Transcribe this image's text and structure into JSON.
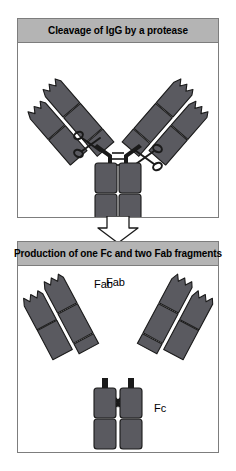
{
  "figure": {
    "type": "diagram",
    "background_color": "#ffffff",
    "panel_border_color": "#7d7d7d",
    "header_fill_color": "#b4b4b4",
    "protein_fill_color": "#5a5a60",
    "protein_outline_color": "#1a1a1a",
    "arrow_fill_color": "#ffffff",
    "arrow_outline_color": "#1a1a1a"
  },
  "panels": [
    {
      "id": "top",
      "title": "Cleavage of IgG by a protease",
      "caption": "",
      "elements": {
        "molecule": "intact IgG antibody, Y-shape",
        "arms": 2,
        "domains_per_chain": 2,
        "scissors_count": 2,
        "scissors_label": "protease"
      }
    },
    {
      "id": "bottom",
      "title": "Production of one Fc and two Fab fragments",
      "caption": "",
      "elements": {
        "fragments": [
          {
            "label": "Fab",
            "position": "left"
          },
          {
            "label": "Fab",
            "position": "right"
          },
          {
            "label": "Fc",
            "position": "bottom-center"
          }
        ]
      }
    }
  ],
  "labels": {
    "fab_left": "Fab",
    "fab_right": "Fab",
    "fc": "Fc"
  },
  "arrow": {
    "direction": "down",
    "meaning": "leads to"
  }
}
